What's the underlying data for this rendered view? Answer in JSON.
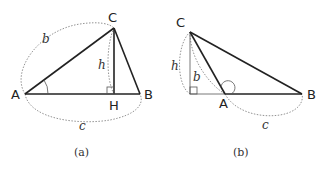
{
  "figures": [
    {
      "caption": "(a)",
      "vertices": {
        "A": "A",
        "B": "B",
        "C": "C",
        "H": "H"
      },
      "sides": {
        "b": "b",
        "h": "h",
        "c": "c"
      },
      "description": "Acute triangle ABC with altitude CH from C to AB; angle at A marked; right angle at H"
    },
    {
      "caption": "(b)",
      "vertices": {
        "A": "A",
        "B": "B",
        "C": "C"
      },
      "sides": {
        "b": "b",
        "h": "h",
        "c": "c"
      },
      "description": "Obtuse triangle ABC with obtuse angle at A; altitude h from C to extension of BA; right angle marked at foot"
    }
  ]
}
